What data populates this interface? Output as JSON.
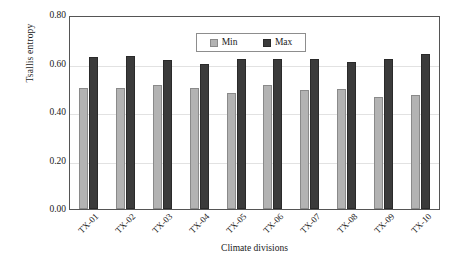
{
  "chart_data": {
    "type": "bar",
    "title": "",
    "xlabel": "Climate divisions",
    "ylabel": "Tsallis entropy",
    "categories": [
      "TX-01",
      "TX-02",
      "TX-03",
      "TX-04",
      "TX-05",
      "TX-06",
      "TX-07",
      "TX-08",
      "TX-09",
      "TX-10"
    ],
    "series": [
      {
        "name": "Min",
        "color": "#b3b3b3",
        "values": [
          0.5,
          0.5,
          0.51,
          0.5,
          0.48,
          0.51,
          0.49,
          0.495,
          0.46,
          0.47
        ]
      },
      {
        "name": "Max",
        "color": "#3b3b3b",
        "values": [
          0.625,
          0.63,
          0.615,
          0.6,
          0.617,
          0.617,
          0.62,
          0.607,
          0.62,
          0.64
        ]
      }
    ],
    "ylim": [
      0.0,
      0.8
    ],
    "y_ticks": [
      "0.00",
      "0.20",
      "0.40",
      "0.60",
      "0.80"
    ],
    "y_tick_values": [
      0.0,
      0.2,
      0.4,
      0.6,
      0.8
    ],
    "gridlines": [
      0.2,
      0.4,
      0.6
    ],
    "grid": true,
    "legend_position": "top-center"
  },
  "legend": {
    "items": [
      {
        "label": "Min",
        "swatch": "min-swatch"
      },
      {
        "label": "Max",
        "swatch": "max-swatch"
      }
    ]
  }
}
